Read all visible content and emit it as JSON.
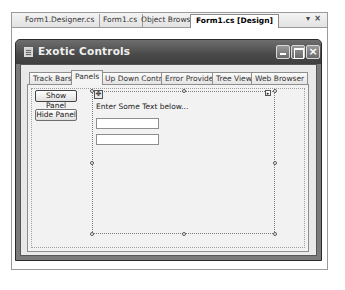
{
  "document_tabs": [
    {
      "label": "Form1.Designer.cs",
      "active": false
    },
    {
      "label": "Form1.cs",
      "active": false
    },
    {
      "label": "Object Browser",
      "active": false
    },
    {
      "label": "Form1.cs [Design]",
      "active": true
    }
  ],
  "document_controls": {
    "dropdown": "▾",
    "close": "×"
  },
  "form": {
    "title": "Exotic Controls",
    "buttons": {
      "minimize": "_",
      "maximize": "□",
      "close": "×"
    }
  },
  "tab_control": {
    "tabs": [
      {
        "label": "Track Bars",
        "active": false
      },
      {
        "label": "Panels",
        "active": true
      },
      {
        "label": "Up Down Controls",
        "active": false
      },
      {
        "label": "Error Provider",
        "active": false
      },
      {
        "label": "Tree View",
        "active": false
      },
      {
        "label": "Web Browser",
        "active": false
      }
    ]
  },
  "panels_page": {
    "show_panel_button": "Show Panel",
    "hide_panel_button": "Hide Panel",
    "panel": {
      "label": "Enter Some Text below...",
      "textbox1_value": "",
      "textbox2_value": "",
      "move_glyph": "✥",
      "smart_tag": "▸"
    }
  }
}
